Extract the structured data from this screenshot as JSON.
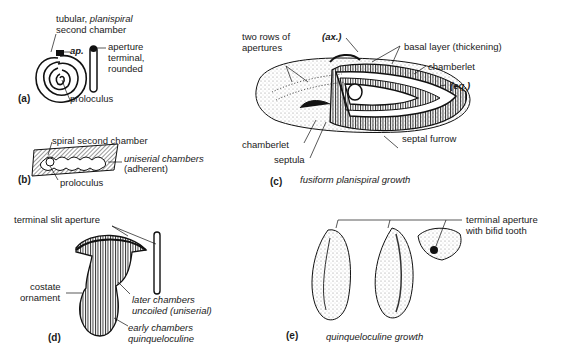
{
  "figure": {
    "panels": [
      {
        "id": "a",
        "label": "(a)",
        "annotations": {
          "tubular": "tubular, ",
          "planispiral": "planispiral",
          "second_chamber": "second chamber",
          "ap": "ap.",
          "aperture": "aperture",
          "terminal": "terminal,",
          "rounded": "rounded",
          "proloculus": "proloculus"
        }
      },
      {
        "id": "b",
        "label": "(b)",
        "annotations": {
          "spiral_second_chamber": "spiral second chamber",
          "uniserial_chambers": "uniserial chambers",
          "adherent": "(adherent)",
          "proloculus": "proloculus"
        }
      },
      {
        "id": "c",
        "label": "(c)",
        "caption": "fusiform planispiral growth",
        "annotations": {
          "two_rows_1": "two rows of",
          "two_rows_2": "apertures",
          "ax": "(ax.)",
          "basal_layer": "basal layer (thickening)",
          "chamberlet_right": "chamberlet",
          "eq": "(eq.)",
          "chamberlet_left": "chamberlet",
          "septula": "septula",
          "septal_furrow": "septal furrow"
        }
      },
      {
        "id": "d",
        "label": "(d)",
        "annotations": {
          "terminal_slit_aperture": "terminal slit aperture",
          "costate": "costate",
          "ornament": "ornament",
          "later_chambers": "later chambers",
          "uncoiled": "uncoiled (uniserial)",
          "early_chambers": "early chambers",
          "quinqueloculine": "quinqueloculine"
        }
      },
      {
        "id": "e",
        "label": "(e)",
        "caption": "quinqueloculine growth",
        "annotations": {
          "terminal_aperture": "terminal aperture",
          "bifid_tooth": "with bifid tooth"
        }
      }
    ]
  }
}
